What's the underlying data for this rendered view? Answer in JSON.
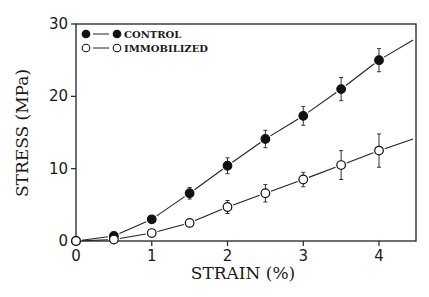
{
  "chart_data": {
    "type": "line",
    "title": "",
    "xlabel": "STRAIN (%)",
    "ylabel": "STRESS (MPa)",
    "xlim": [
      0,
      4.5
    ],
    "ylim": [
      0,
      30
    ],
    "xticks": [
      0,
      1,
      2,
      3,
      4
    ],
    "yticks": [
      0,
      10,
      20,
      30
    ],
    "grid": false,
    "legend_position": "upper-left",
    "x": [
      0,
      0.5,
      1,
      1.5,
      2,
      2.5,
      3,
      3.5,
      4
    ],
    "series": [
      {
        "name": "CONTROL",
        "marker": "filled-circle",
        "values": [
          0,
          0.7,
          3.0,
          6.6,
          10.4,
          14.1,
          17.3,
          21.0,
          25.0
        ],
        "error": [
          0,
          0.2,
          0.3,
          0.8,
          1.1,
          1.2,
          1.3,
          1.6,
          1.6
        ],
        "fit_line_end": [
          4.45,
          27.8
        ]
      },
      {
        "name": "IMMOBILIZED",
        "marker": "open-circle",
        "values": [
          0,
          0.2,
          1.1,
          2.5,
          4.7,
          6.6,
          8.5,
          10.5,
          12.5
        ],
        "error": [
          0,
          0.1,
          0.2,
          0.3,
          0.9,
          1.2,
          1.0,
          2.0,
          2.3
        ],
        "fit_line_end": [
          4.45,
          14.1
        ]
      }
    ]
  }
}
